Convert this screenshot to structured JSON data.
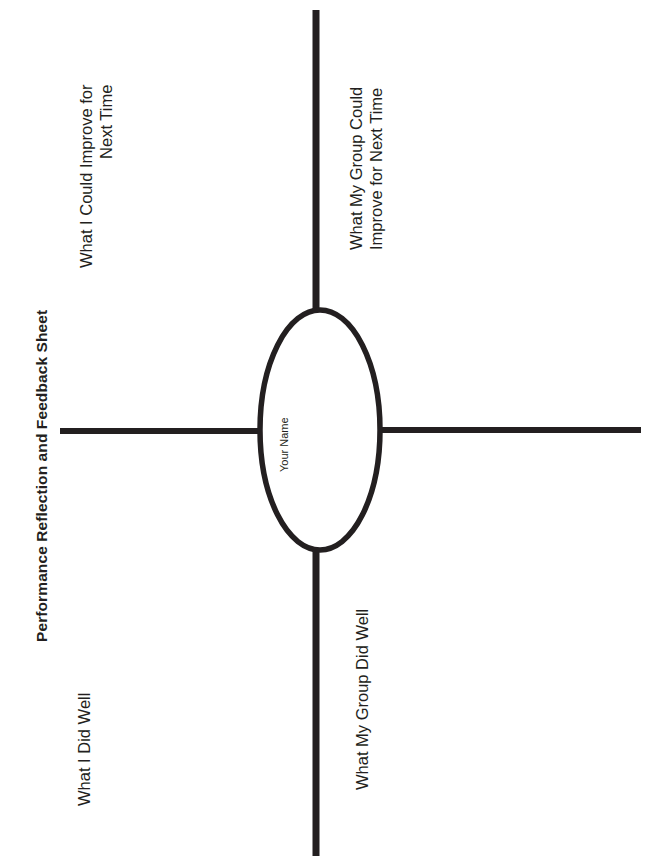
{
  "document": {
    "title": "Performance Reflection and Feedback Sheet",
    "orientation": "rotated-90-counterclockwise",
    "page_background": "#ffffff",
    "ink_color": "#231f20"
  },
  "center": {
    "shape": "ellipse",
    "label": "Your Name",
    "cx": 320,
    "cy": 430,
    "rx": 60,
    "ry": 120,
    "stroke_width": 5
  },
  "branches": [
    {
      "id": "improve-self",
      "label": "What I Could Improve for\nNext Time",
      "direction": "left-up",
      "quadrant": "upper-left"
    },
    {
      "id": "improve-group",
      "label": "What My Group Could\nImprove for Next Time",
      "direction": "up",
      "quadrant": "upper-right"
    },
    {
      "id": "did-well-self",
      "label": "What I Did Well",
      "direction": "left-down",
      "quadrant": "lower-left"
    },
    {
      "id": "did-well-group",
      "label": "What My Group Did Well",
      "direction": "down",
      "quadrant": "lower-right"
    }
  ],
  "lines": [
    {
      "id": "line-top",
      "x1": 316,
      "y1": 10,
      "x2": 316,
      "y2": 312
    },
    {
      "id": "line-bottom",
      "x1": 316,
      "y1": 548,
      "x2": 316,
      "y2": 856
    },
    {
      "id": "line-left",
      "x1": 60,
      "y1": 431,
      "x2": 258,
      "y2": 431
    },
    {
      "id": "line-right",
      "x1": 382,
      "y1": 430,
      "x2": 641,
      "y2": 430
    }
  ]
}
